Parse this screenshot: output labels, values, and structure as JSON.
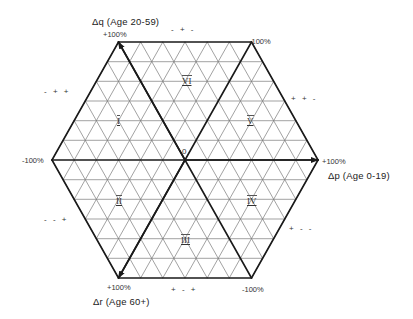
{
  "diagram": {
    "type": "hexagonal-ternary-change-diagram",
    "center": [
      185,
      160
    ],
    "half_width": 133,
    "half_height": 118,
    "subdivisions": 6,
    "colors": {
      "grid": "#7a7a7a",
      "frame": "#1a1a1a",
      "axis": "#1a1a1a",
      "background": "#ffffff"
    },
    "axes": [
      {
        "id": "q",
        "title": "Δq (Age 20-59)",
        "plus_label": "+100%",
        "minus_label": "-100%",
        "plus_vertex": "top-left",
        "minus_vertex": "bottom-right"
      },
      {
        "id": "p",
        "title": "Δp (Age 0-19)",
        "plus_label": "+100%",
        "minus_label": "-100%",
        "plus_vertex": "right",
        "minus_vertex": "left"
      },
      {
        "id": "r",
        "title": "Δr (Age 60+)",
        "plus_label": "+100%",
        "minus_label": "-100%",
        "plus_vertex": "bottom-left",
        "minus_vertex": "top-right"
      }
    ],
    "origin_label": "0",
    "regions": [
      {
        "id": "I",
        "label": "I"
      },
      {
        "id": "II",
        "label": "II"
      },
      {
        "id": "III",
        "label": "III"
      },
      {
        "id": "IV",
        "label": "IV"
      },
      {
        "id": "V",
        "label": "V"
      },
      {
        "id": "VI",
        "label": "VI"
      }
    ],
    "sign_patterns": {
      "top": "- + -",
      "upper_right": "+ + -",
      "lower_right": "+ - -",
      "bottom": "+ - +",
      "lower_left": "- - +",
      "upper_left": "- + +"
    }
  }
}
